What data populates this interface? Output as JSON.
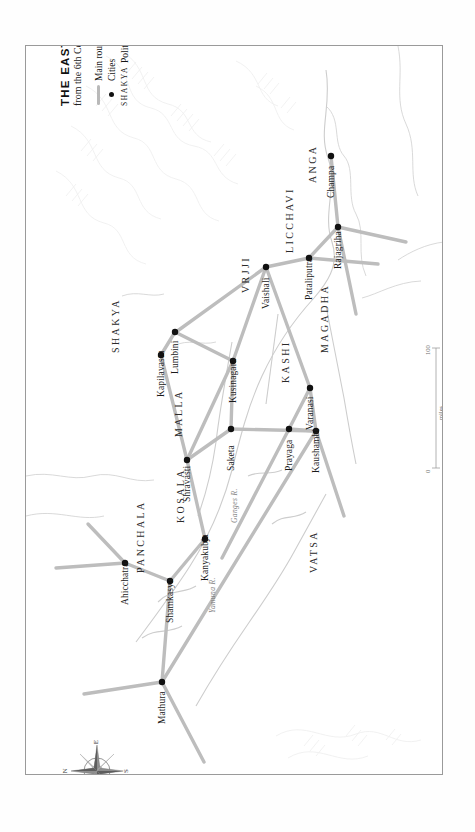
{
  "map": {
    "title": "THE EASTERN GANGES REGION",
    "subtitle_prefix": "from the 6th Century ",
    "subtitle_era": "BCE",
    "legend": {
      "routes_label": "Main routes",
      "cities_label": "Cities",
      "regions_sample": "SHAKYA",
      "regions_label": "Political regions"
    },
    "scale": {
      "miles_label": "miles",
      "km_label": "kilometres",
      "miles_max": "100",
      "miles_min": "0",
      "km_max": "100",
      "km_min": "0"
    },
    "compass": {
      "n": "N",
      "e": "E",
      "s": "S",
      "w": "W"
    },
    "colors": {
      "route": "#bdbdbd",
      "city_dot": "#111111",
      "river": "#c9c9c9",
      "frame": "#9a9a9a",
      "terrain": "#f2f2f2"
    }
  },
  "cities": [
    {
      "name": "Champa",
      "x": 330,
      "y": 155
    },
    {
      "name": "Rajagriha",
      "x": 337,
      "y": 226
    },
    {
      "name": "Pataliputra",
      "x": 308,
      "y": 257
    },
    {
      "name": "Vaishali",
      "x": 265,
      "y": 266
    },
    {
      "name": "Lumbini",
      "x": 174,
      "y": 331
    },
    {
      "name": "Kapilavastu",
      "x": 160,
      "y": 354
    },
    {
      "name": "Kusinagara",
      "x": 232,
      "y": 360
    },
    {
      "name": "Varanasi",
      "x": 309,
      "y": 387
    },
    {
      "name": "Saketa",
      "x": 230,
      "y": 428
    },
    {
      "name": "Kaushambi",
      "x": 315,
      "y": 430
    },
    {
      "name": "Prayaga",
      "x": 288,
      "y": 428
    },
    {
      "name": "Shravasti",
      "x": 186,
      "y": 459
    },
    {
      "name": "Kanyakubja",
      "x": 204,
      "y": 538
    },
    {
      "name": "Shamkasya",
      "x": 169,
      "y": 580
    },
    {
      "name": "Ahicchatra",
      "x": 124,
      "y": 562
    },
    {
      "name": "Mathura",
      "x": 161,
      "y": 681
    }
  ],
  "regions": [
    {
      "name": "ANGA",
      "x": 310,
      "y": 130
    },
    {
      "name": "LICCHAVI",
      "x": 287,
      "y": 200
    },
    {
      "name": "VRJJI",
      "x": 243,
      "y": 240
    },
    {
      "name": "MAGADHA",
      "x": 322,
      "y": 300
    },
    {
      "name": "SHAKYA",
      "x": 113,
      "y": 300
    },
    {
      "name": "KASHI",
      "x": 283,
      "y": 330
    },
    {
      "name": "MALLA",
      "x": 176,
      "y": 384
    },
    {
      "name": "KOSALA",
      "x": 178,
      "y": 470
    },
    {
      "name": "VATSA",
      "x": 311,
      "y": 520
    },
    {
      "name": "PANCHALA",
      "x": 138,
      "y": 520
    }
  ],
  "rivers": [
    {
      "name": "Ganges R.",
      "x": 232,
      "y": 488
    },
    {
      "name": "Yamuna R.",
      "x": 210,
      "y": 578
    }
  ]
}
